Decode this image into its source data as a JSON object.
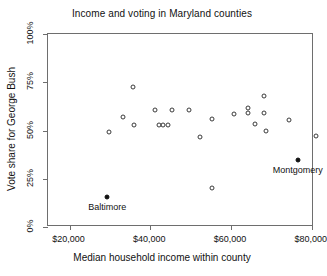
{
  "chart_data": {
    "type": "scatter",
    "title": "Income and voting in Maryland counties",
    "xlabel": "Median household income within county",
    "ylabel": "Vote share for George Bush",
    "xlim": [
      14667,
      80533
    ],
    "ylim": [
      0,
      100
    ],
    "grid": false,
    "legend": null,
    "xticks": [
      20000,
      40000,
      60000,
      80000
    ],
    "xticklabels": [
      "$20,000",
      "$40,000",
      "$60,000",
      "$80,000"
    ],
    "yticks": [
      0,
      25,
      50,
      75,
      100
    ],
    "yticklabels": [
      "0%",
      "25%",
      "50%",
      "75%",
      "100%"
    ],
    "series": [
      {
        "name": "Maryland counties",
        "marker": "open-circle",
        "points": [
          {
            "x": 29867,
            "y": 49.0
          },
          {
            "x": 33333,
            "y": 56.8
          },
          {
            "x": 35733,
            "y": 72.4
          },
          {
            "x": 36000,
            "y": 53.1
          },
          {
            "x": 41067,
            "y": 60.4
          },
          {
            "x": 42133,
            "y": 53.1
          },
          {
            "x": 43200,
            "y": 53.1
          },
          {
            "x": 44267,
            "y": 53.1
          },
          {
            "x": 45333,
            "y": 60.4
          },
          {
            "x": 49600,
            "y": 60.4
          },
          {
            "x": 52267,
            "y": 46.4
          },
          {
            "x": 55200,
            "y": 55.7
          },
          {
            "x": 55200,
            "y": 20.3
          },
          {
            "x": 60800,
            "y": 58.3
          },
          {
            "x": 64267,
            "y": 61.9
          },
          {
            "x": 64267,
            "y": 58.9
          },
          {
            "x": 65867,
            "y": 53.6
          },
          {
            "x": 68267,
            "y": 67.7
          },
          {
            "x": 68267,
            "y": 58.9
          },
          {
            "x": 68533,
            "y": 49.5
          },
          {
            "x": 74400,
            "y": 55.2
          },
          {
            "x": 81067,
            "y": 46.9
          }
        ]
      },
      {
        "name": "Highlighted counties",
        "marker": "filled-circle",
        "points": [
          {
            "x": 29333,
            "y": 15.6,
            "label": "Baltimore"
          },
          {
            "x": 76533,
            "y": 34.9,
            "label": "Montgomery"
          }
        ]
      }
    ]
  },
  "style": {
    "frame_color": "#6e6e6e",
    "point_color": "#3a3a3a",
    "highlight_color": "#111111",
    "background": "#ffffff"
  }
}
